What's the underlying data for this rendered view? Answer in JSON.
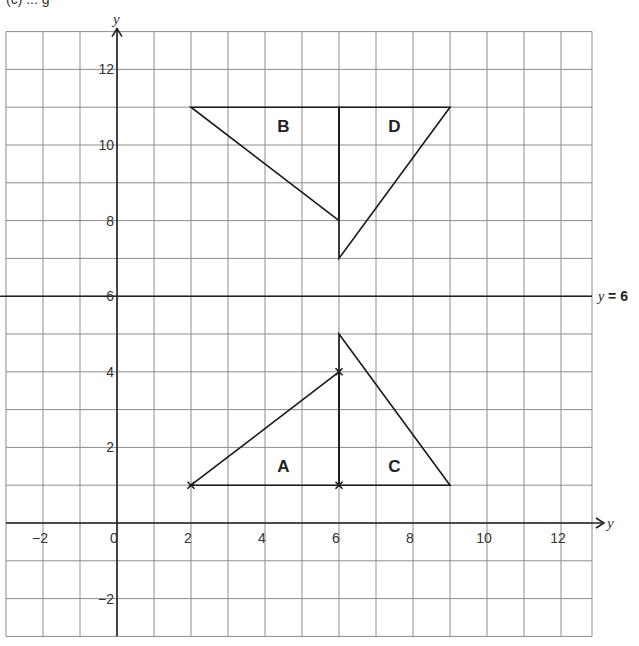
{
  "heading": {
    "text": "(c) ... g"
  },
  "grid": {
    "x_min": -3,
    "x_max": 13,
    "y_min": -3,
    "y_max": 13,
    "origin_px": [
      117,
      523
    ],
    "unit_px_x": 37,
    "unit_px_y": 37.8,
    "grid_color": "#8c8c8c",
    "axis_color": "#222222",
    "shape_color": "#1a1a1a"
  },
  "axes": {
    "x_label": "y",
    "y_label": "y",
    "x_ticks": [
      {
        "value": -2,
        "label": "−2"
      },
      {
        "value": 0,
        "label": "0"
      },
      {
        "value": 2,
        "label": "2"
      },
      {
        "value": 4,
        "label": "4"
      },
      {
        "value": 6,
        "label": "6"
      },
      {
        "value": 8,
        "label": "8"
      },
      {
        "value": 10,
        "label": "10"
      },
      {
        "value": 12,
        "label": "12"
      }
    ],
    "y_ticks": [
      {
        "value": -2,
        "label": "−2"
      },
      {
        "value": 2,
        "label": "2"
      },
      {
        "value": 4,
        "label": "4"
      },
      {
        "value": 6,
        "label": "6"
      },
      {
        "value": 8,
        "label": "8"
      },
      {
        "value": 10,
        "label": "10"
      },
      {
        "value": 12,
        "label": "12"
      }
    ]
  },
  "mirror_line": {
    "equation_var": "y",
    "equation_rest": " = 6",
    "y": 6
  },
  "shapes": [
    {
      "name": "A",
      "vertices": [
        [
          2,
          1
        ],
        [
          6,
          4
        ],
        [
          6,
          1
        ]
      ],
      "label_pos": [
        4.5,
        1.5
      ],
      "crosses": [
        [
          2,
          1
        ],
        [
          6,
          4
        ],
        [
          6,
          1
        ]
      ]
    },
    {
      "name": "B",
      "vertices": [
        [
          2,
          11
        ],
        [
          6,
          11
        ],
        [
          6,
          8
        ]
      ],
      "label_pos": [
        4.5,
        10.5
      ],
      "crosses": []
    },
    {
      "name": "C",
      "vertices": [
        [
          6,
          5
        ],
        [
          9,
          1
        ],
        [
          6,
          1
        ]
      ],
      "label_pos": [
        7.5,
        1.5
      ],
      "crosses": []
    },
    {
      "name": "D",
      "vertices": [
        [
          6,
          11
        ],
        [
          9,
          11
        ],
        [
          6,
          7
        ]
      ],
      "label_pos": [
        7.5,
        10.5
      ],
      "crosses": []
    }
  ]
}
